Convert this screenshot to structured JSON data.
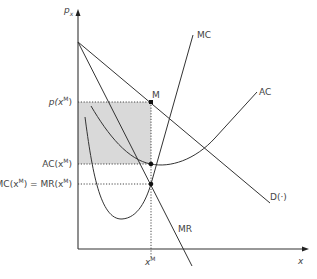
{
  "diagram": {
    "type": "monopoly-profit-diagram",
    "axes": {
      "y_label": "p_x",
      "x_label": "x"
    },
    "curves": [
      {
        "name": "MC",
        "label": "MC",
        "shape": "u-shaped"
      },
      {
        "name": "AC",
        "label": "AC",
        "shape": "u-shaped"
      },
      {
        "name": "D",
        "label": "D(·)",
        "shape": "linear-downward"
      },
      {
        "name": "MR",
        "label": "MR",
        "shape": "linear-downward"
      }
    ],
    "points": [
      {
        "name": "M",
        "label": "M"
      }
    ],
    "y_ticks": {
      "price": "p(x^M)",
      "ac": "AC(x^M)",
      "mc_mr": "MC(x^M) = MR(x^M)"
    },
    "x_ticks": {
      "quantity": "x^M"
    },
    "shaded_region": "profit rectangle between p(x^M) and AC(x^M), from 0 to x^M",
    "colors": {
      "line": "#333333",
      "shade": "#d9d9d9",
      "text": "#444444"
    }
  },
  "labels": {
    "px": "p",
    "px_sub": "x",
    "x_axis": "x",
    "MC": "MC",
    "AC": "AC",
    "D": "D(·)",
    "MR": "MR",
    "M": "M",
    "p_xM_pre": "p(x",
    "p_xM_sup": "M",
    "p_xM_post": ")",
    "AC_xM_pre": "AC(x",
    "AC_xM_sup": "M",
    "AC_xM_post": ")",
    "MC_pre": "MC(x",
    "MC_sup": "M",
    "MC_mid": ") = MR(x",
    "MR_sup": "M",
    "MR_post": ")",
    "xM": "x",
    "xM_sup": "M"
  }
}
